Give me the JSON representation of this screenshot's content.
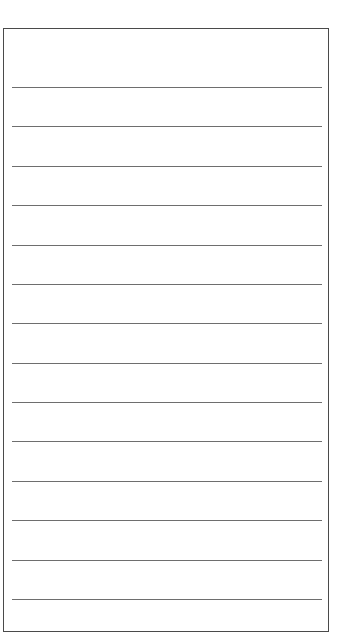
{
  "page": {
    "type": "lined-writing-paper",
    "frame": {
      "left": 3,
      "top": 28,
      "width": 324,
      "height": 602,
      "border_color": "#4a4a4a"
    },
    "lines": {
      "count": 14,
      "color": "#6e6e6e",
      "positions_y": [
        87,
        130,
        172,
        215,
        258,
        301,
        343,
        386,
        429,
        471,
        514,
        557,
        599,
        600
      ]
    },
    "text_content": []
  }
}
